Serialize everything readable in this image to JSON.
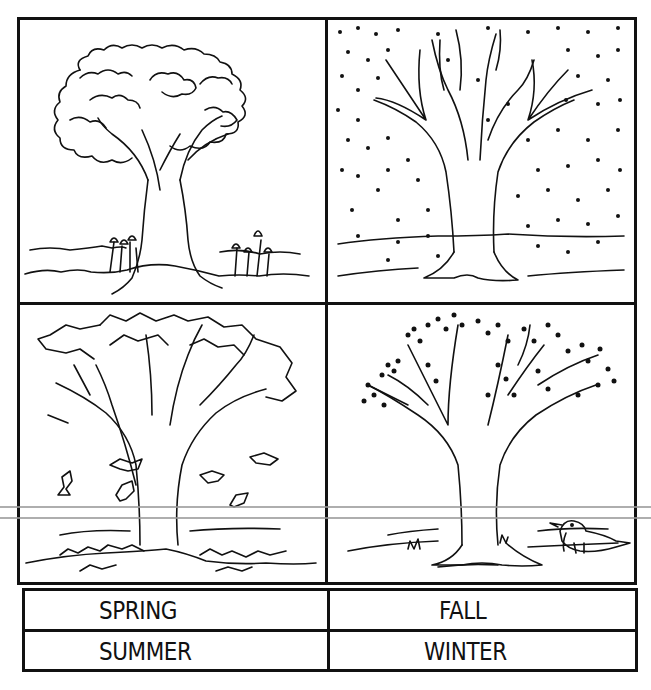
{
  "worksheet": {
    "panels": [
      {
        "position": "top-left",
        "season_depicted": "summer",
        "description": "Tree with full leafy canopy, tulips at base, grassy ground"
      },
      {
        "position": "top-right",
        "season_depicted": "winter",
        "description": "Bare-branched tree with falling snow dots"
      },
      {
        "position": "bottom-left",
        "season_depicted": "fall",
        "description": "Tree with jagged leaves, leaves falling and piled on ground"
      },
      {
        "position": "bottom-right",
        "season_depicted": "spring",
        "description": "Tree with budding blossoms on branches, bird with worm on ground"
      }
    ],
    "labels": {
      "row1": {
        "left": "SPRING",
        "right": "FALL"
      },
      "row2": {
        "left": "SUMMER",
        "right": "WINTER"
      }
    }
  },
  "colors": {
    "ink": "#111111",
    "paper": "#ffffff",
    "scan_line": "#9a9a9a"
  }
}
